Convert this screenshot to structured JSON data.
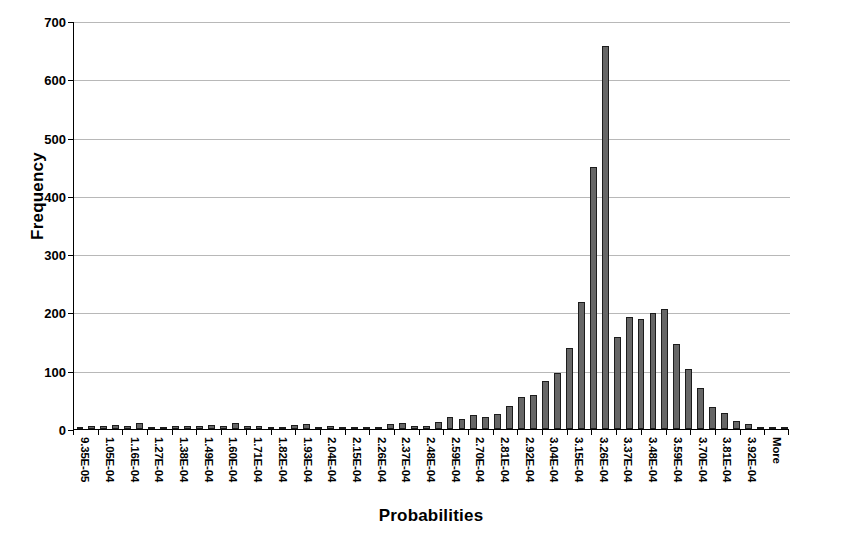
{
  "chart_data": {
    "type": "bar",
    "title": "",
    "xlabel": "Probabilities",
    "ylabel": "Frequency",
    "ylim": [
      0,
      700
    ],
    "ytick_values": [
      0,
      100,
      200,
      300,
      400,
      500,
      600,
      700
    ],
    "ytick_labels": [
      "0",
      "100",
      "200",
      "300",
      "400",
      "500",
      "600",
      "700"
    ],
    "grid": "horizontal",
    "legend": "none",
    "bar_color": "#666666",
    "bar_edge_color": "#1c1c1c",
    "gridline_color": "#b8b8b8",
    "axis_color": "#000000",
    "categories": [
      "9.35E-05",
      "1.05E-04",
      "1.16E-04",
      "1.27E-04",
      "1.38E-04",
      "1.49E-04",
      "1.60E-04",
      "1.71E-04",
      "1.82E-04",
      "1.93E-04",
      "2.04E-04",
      "2.15E-04",
      "2.26E-04",
      "2.37E-04",
      "2.48E-04",
      "2.59E-04",
      "2.70E-04",
      "2.81E-04",
      "2.92E-04",
      "3.04E-04",
      "3.15E-04",
      "3.26E-04",
      "3.37E-04",
      "3.48E-04",
      "3.59E-04",
      "3.70E-04",
      "3.81E-04",
      "3.92E-04",
      "More"
    ],
    "values": [
      1,
      6,
      7,
      11,
      4,
      6,
      7,
      11,
      6,
      2,
      9,
      5,
      4,
      2,
      10,
      6,
      20,
      24,
      55,
      83,
      139,
      658,
      159,
      193,
      207,
      104,
      38,
      13,
      0
    ]
  },
  "series_detail": {
    "bins": [
      {
        "label": "9.35E-05",
        "frequency": 1
      },
      {
        "label": "1.05E-04",
        "frequency": 6
      },
      {
        "label": "1.16E-04",
        "frequency": 7
      },
      {
        "label": "1.27E-04",
        "frequency": 11
      },
      {
        "label": "1.38E-04",
        "frequency": 4
      },
      {
        "label": "1.49E-04",
        "frequency": 6
      },
      {
        "label": "1.60E-04",
        "frequency": 7
      },
      {
        "label": "1.71E-04",
        "frequency": 11
      },
      {
        "label": "1.82E-04",
        "frequency": 6
      },
      {
        "label": "1.93E-04",
        "frequency": 2
      },
      {
        "label": "2.04E-04",
        "frequency": 9
      },
      {
        "label": "2.15E-04",
        "frequency": 5
      },
      {
        "label": "2.26E-04",
        "frequency": 4
      },
      {
        "label": "2.37E-04",
        "frequency": 2
      },
      {
        "label": "2.48E-04",
        "frequency": 10
      },
      {
        "label": "2.59E-04",
        "frequency": 6
      },
      {
        "label": "2.70E-04",
        "frequency": 20
      },
      {
        "label": "2.81E-04",
        "frequency": 24
      },
      {
        "label": "2.92E-04",
        "frequency": 55
      },
      {
        "label": "3.04E-04",
        "frequency": 83
      },
      {
        "label": "3.15E-04",
        "frequency": 139
      },
      {
        "label": "3.26E-04",
        "frequency": 658
      },
      {
        "label": "3.37E-04",
        "frequency": 159
      },
      {
        "label": "3.48E-04",
        "frequency": 193
      },
      {
        "label": "3.59E-04",
        "frequency": 207
      },
      {
        "label": "3.70E-04",
        "frequency": 104
      },
      {
        "label": "3.81E-04",
        "frequency": 38
      },
      {
        "label": "3.92E-04",
        "frequency": 13
      },
      {
        "label": "More",
        "frequency": 0
      }
    ]
  },
  "extra_bars": {
    "comment": "Rendered bar list includes intermediate sub-bars visible between printed tick labels",
    "values": [
      1,
      6,
      5,
      7,
      6,
      11,
      3,
      4,
      5,
      6,
      5,
      7,
      6,
      11,
      5,
      6,
      3,
      2,
      7,
      9,
      4,
      5,
      3,
      4,
      2,
      2,
      8,
      10,
      5,
      6,
      12,
      20,
      17,
      24,
      21,
      25,
      40,
      55,
      58,
      83,
      97,
      139,
      218,
      450,
      658,
      159,
      193,
      190,
      199,
      207,
      146,
      104,
      70,
      38,
      28,
      13,
      9,
      2,
      1,
      0
    ]
  }
}
